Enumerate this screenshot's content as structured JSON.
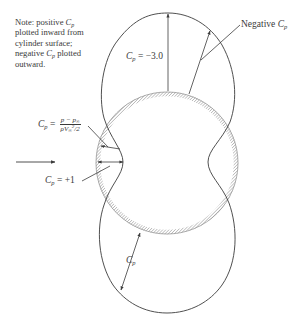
{
  "note": {
    "line1_prefix": "Note: positive ",
    "line1_symbol": "C",
    "line1_sub": "p",
    "line2": "plotted inward from",
    "line3": "cylinder surface;",
    "line4_prefix": "negative ",
    "line4_symbol": "C",
    "line4_sub": "p",
    "line4_suffix": " plotted",
    "line5": "outward."
  },
  "labels": {
    "top_cp": {
      "symbol": "C",
      "sub": "p",
      "value": " = −3.0"
    },
    "negative_cp": {
      "text": "Negative ",
      "symbol": "C",
      "sub": "p"
    },
    "definition": {
      "symbol": "C",
      "sub": "p",
      "equals": " = ",
      "numerator": "p − p",
      "numerator_sub": "∞",
      "denominator": "ρV",
      "denominator_sub": "∞",
      "denominator_sup": "2",
      "denominator_tail": "/2"
    },
    "stagnation_cp": {
      "symbol": "C",
      "sub": "p",
      "value": " = +1"
    },
    "bottom_cp": {
      "symbol": "C",
      "sub": "p"
    }
  },
  "geometry": {
    "cylinder_center": [
      167,
      163
    ],
    "cylinder_radius": 71,
    "top_lobe_apex": [
      168,
      13
    ],
    "bottom_lobe_apex": [
      167,
      313
    ],
    "left_waist_x": 123,
    "right_waist_x": 208,
    "flow_arrow": {
      "from": [
        16,
        162
      ],
      "to": [
        55,
        162
      ]
    }
  },
  "colors": {
    "line": "#3c3c3c",
    "hatch": "#8a8a8a",
    "text": "#3a3a3a"
  }
}
